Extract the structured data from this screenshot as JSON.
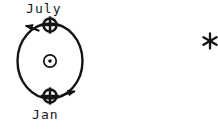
{
  "diagram": {
    "title_text": "",
    "background_color": "#ffffff",
    "ink_color": "#141414",
    "labels": {
      "top": "July",
      "bottom": "Jan"
    },
    "symbols": {
      "sun": "sun-symbol",
      "earth_top": "earth-symbol",
      "earth_bottom": "earth-symbol",
      "star": "star-asterisk",
      "orbit": "orbit-ellipse",
      "arrow_top": "motion-arrow-left",
      "arrow_bottom": "motion-arrow-right"
    },
    "geometry": {
      "orbit_center_x": 50,
      "orbit_center_y": 61,
      "orbit_radius_x": 33,
      "orbit_radius_y": 42,
      "sun_x": 50,
      "sun_y": 61,
      "earth_top_x": 50,
      "earth_top_y": 24,
      "earth_bottom_x": 50,
      "earth_bottom_y": 97,
      "star_x": 210,
      "star_y": 41
    }
  }
}
